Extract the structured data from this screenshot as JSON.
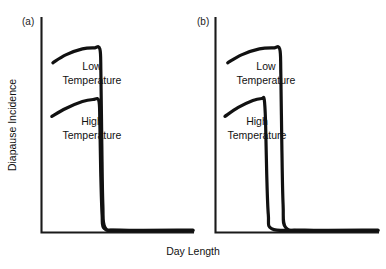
{
  "figure": {
    "background": "#ffffff",
    "ink_color": "#111111",
    "axis_color": "#1a1a1a",
    "x_axis_title": "Day Length",
    "y_axis_title": "Diapause Incidence"
  },
  "chart_data": {
    "type": "line",
    "title": "",
    "xlabel": "Day Length",
    "ylabel": "Diapause Incidence",
    "grid": false,
    "legend": "inline-annotations",
    "axis_ticks": false,
    "axis_tick_labels": false,
    "panels": [
      {
        "id": "a",
        "label": "(a)",
        "note": "critical day length identical for both temperatures",
        "series": [
          {
            "name": "Low Temperature",
            "label_lines": [
              "Low",
              "Temperature"
            ],
            "plateau_level_relative": 0.93,
            "critical_day_length_relative": 0.39,
            "floor_level_relative": 0.0,
            "x": [
              0.075,
              0.16,
              0.27,
              0.345,
              0.385,
              0.392,
              0.398,
              0.405,
              0.42,
              0.52,
              1.0
            ],
            "y": [
              0.855,
              0.895,
              0.925,
              0.93,
              0.925,
              0.8,
              0.45,
              0.14,
              0.025,
              0.012,
              0.012
            ]
          },
          {
            "name": "High Temperature",
            "label_lines": [
              "High",
              "Temperature"
            ],
            "plateau_level_relative": 0.67,
            "critical_day_length_relative": 0.385,
            "floor_level_relative": 0.0,
            "x": [
              0.068,
              0.16,
              0.27,
              0.34,
              0.378,
              0.385,
              0.391,
              0.4,
              0.415,
              0.52,
              1.0
            ],
            "y": [
              0.585,
              0.625,
              0.66,
              0.67,
              0.665,
              0.56,
              0.3,
              0.09,
              0.02,
              0.01,
              0.01
            ]
          }
        ]
      },
      {
        "id": "b",
        "label": "(b)",
        "note": "high temperature curve drops at a shorter critical day length than low temperature",
        "series": [
          {
            "name": "Low Temperature",
            "label_lines": [
              "Low",
              "Temperature"
            ],
            "plateau_level_relative": 0.93,
            "critical_day_length_relative": 0.4,
            "floor_level_relative": 0.0,
            "x": [
              0.075,
              0.16,
              0.27,
              0.355,
              0.395,
              0.402,
              0.408,
              0.416,
              0.432,
              0.55,
              1.0
            ],
            "y": [
              0.855,
              0.895,
              0.925,
              0.93,
              0.925,
              0.8,
              0.45,
              0.14,
              0.025,
              0.012,
              0.012
            ]
          },
          {
            "name": "High Temperature",
            "label_lines": [
              "High",
              "Temperature"
            ],
            "plateau_level_relative": 0.67,
            "critical_day_length_relative": 0.305,
            "floor_level_relative": 0.0,
            "x": [
              0.058,
              0.14,
              0.23,
              0.285,
              0.3,
              0.308,
              0.315,
              0.325,
              0.345,
              0.5,
              1.0
            ],
            "y": [
              0.585,
              0.63,
              0.665,
              0.675,
              0.67,
              0.56,
              0.3,
              0.09,
              0.02,
              0.01,
              0.01
            ]
          }
        ]
      }
    ]
  },
  "panel_a": {
    "label": "(a)",
    "low_label_line1": "Low",
    "low_label_line2": "Temperature",
    "high_label_line1": "High",
    "high_label_line2": "Temperature"
  },
  "panel_b": {
    "label": "(b)",
    "low_label_line1": "Low",
    "low_label_line2": "Temperature",
    "high_label_line1": "High",
    "high_label_line2": "Temperature"
  }
}
